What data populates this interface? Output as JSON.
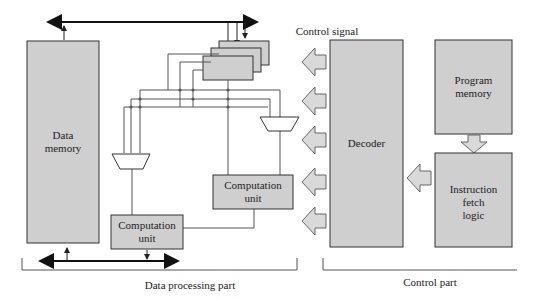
{
  "colors": {
    "block_fill": "#cfcfcf",
    "stroke": "#333333",
    "wire": "#444444",
    "background": "#ffffff"
  },
  "blocks": {
    "data_memory": {
      "label": "Data\nmemory"
    },
    "computation_unit_upper": {
      "label": "Computation\nunit"
    },
    "computation_unit_lower": {
      "label": "Computation\nunit"
    },
    "decoder": {
      "label": "Decoder"
    },
    "program_memory": {
      "label": "Program\nmemory"
    },
    "instruction_fetch_logic": {
      "label": "Instruction\nfetch\nlogic"
    }
  },
  "annotations": {
    "control_signal": "Control signal"
  },
  "groups": {
    "data_processing_part": "Data processing part",
    "control_part": "Control part"
  }
}
